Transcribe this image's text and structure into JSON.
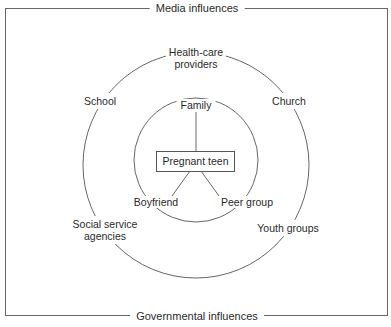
{
  "frame": {
    "top_label": "Media influences",
    "bottom_label": "Governmental influences"
  },
  "center": {
    "label": "Pregnant teen"
  },
  "inner_ring": {
    "items": [
      "Family",
      "Boyfriend",
      "Peer group"
    ]
  },
  "outer_ring": {
    "items": [
      "Health-care",
      "providers",
      "School",
      "Church",
      "Social service",
      "agencies",
      "Youth groups"
    ]
  },
  "colors": {
    "line": "#555555",
    "text": "#2a2a2a",
    "background": "#ffffff"
  }
}
